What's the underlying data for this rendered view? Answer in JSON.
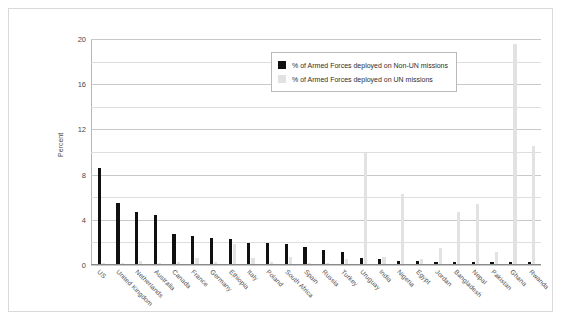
{
  "chart_data": {
    "type": "bar",
    "title": "",
    "xlabel": "",
    "ylabel": "Percent",
    "ylim": [
      0,
      20
    ],
    "yticks": [
      0,
      4,
      8,
      12,
      16,
      20
    ],
    "grid": true,
    "legend_position": "upper-right",
    "categories": [
      "US",
      "United Kingdom",
      "Netherlands",
      "Australia",
      "Canada",
      "France",
      "Germany",
      "Ethiopia",
      "Italy",
      "Poland",
      "South Africa",
      "Spain",
      "Russia",
      "Turkey",
      "Uruguay",
      "India",
      "Nigeria",
      "Egypt",
      "Jordan",
      "Bangladesh",
      "Nepal",
      "Pakistan",
      "Ghana",
      "Rwanda"
    ],
    "series": [
      {
        "name": "% of Armed Forces deployed on Non-UN missions",
        "color": "#101010",
        "values": [
          8.5,
          5.4,
          4.6,
          4.3,
          2.7,
          2.5,
          2.3,
          2.2,
          1.9,
          1.9,
          1.8,
          1.5,
          1.2,
          1.1,
          0.5,
          0.4,
          0.3,
          0.3,
          0.2,
          0.2,
          0.2,
          0.2,
          0.2,
          0.2
        ]
      },
      {
        "name": "% of Armed Forces deployed on UN missions",
        "color": "#e2e2e2",
        "values": [
          0.1,
          0.1,
          0.3,
          0.1,
          0.2,
          0.5,
          0.2,
          1.8,
          0.5,
          0.2,
          0.6,
          0.1,
          0.1,
          0.4,
          9.8,
          0.6,
          6.2,
          0.4,
          1.4,
          4.6,
          5.3,
          1.1,
          19.5,
          10.4
        ]
      }
    ],
    "legend": [
      {
        "label": "% of Armed Forces deployed on Non-UN missions",
        "color": "#101010"
      },
      {
        "label": "% of Armed Forces deployed on UN missions",
        "color": "#e2e2e2"
      }
    ]
  }
}
